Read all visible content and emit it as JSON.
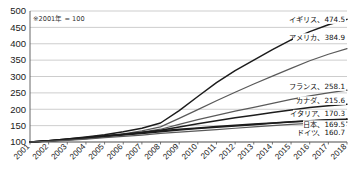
{
  "note": "※2001年 = 100",
  "chart_data": {
    "type": "line",
    "title": "",
    "subtitle": "",
    "xlabel": "",
    "ylabel": "",
    "note": "※2001年 = 100",
    "grid": true,
    "legend_position": "inline-right-end-labels",
    "ylim": [
      100,
      500
    ],
    "yticks": [
      100,
      150,
      200,
      250,
      300,
      350,
      400,
      450,
      500
    ],
    "ytick_labels": [
      "100",
      "150",
      "200",
      "250",
      "300",
      "350",
      "400",
      "450",
      "500"
    ],
    "x": [
      2001,
      2002,
      2003,
      2004,
      2005,
      2006,
      2007,
      2008,
      2009,
      2010,
      2011,
      2012,
      2013,
      2014,
      2015,
      2016,
      2017,
      2018
    ],
    "xtick_labels": [
      "2001",
      "2002",
      "2003",
      "2004",
      "2005",
      "2006",
      "2007",
      "2008",
      "2009",
      "2010",
      "2011",
      "2012",
      "2013",
      "2014",
      "2015",
      "2016",
      "2017",
      "2018"
    ],
    "series": [
      {
        "name": "イギリス",
        "end_label": "イギリス、474.5",
        "end_value": 474.5,
        "values": [
          100,
          104,
          109,
          115,
          122,
          131,
          142,
          158,
          196,
          239,
          281,
          318,
          350,
          382,
          412,
          437,
          458,
          474.5
        ]
      },
      {
        "name": "アメリカ",
        "end_label": "アメリカ、384.9",
        "end_value": 384.9,
        "values": [
          100,
          103,
          107,
          112,
          118,
          125,
          134,
          146,
          172,
          199,
          226,
          252,
          277,
          301,
          325,
          348,
          368,
          384.9
        ]
      },
      {
        "name": "フランス",
        "end_label": "フランス、258.1",
        "end_value": 258.1,
        "values": [
          100,
          103,
          107,
          112,
          117,
          123,
          130,
          139,
          154,
          168,
          181,
          194,
          206,
          218,
          230,
          241,
          250,
          258.1
        ]
      },
      {
        "name": "カナダ",
        "end_label": "カナダ、215.6",
        "end_value": 215.6,
        "values": [
          100,
          104,
          108,
          113,
          118,
          123,
          129,
          136,
          146,
          156,
          165,
          174,
          182,
          190,
          198,
          205,
          211,
          215.6
        ]
      },
      {
        "name": "イタリア",
        "end_label": "イタリア、170.3",
        "end_value": 170.3,
        "values": [
          100,
          104,
          109,
          114,
          119,
          124,
          129,
          134,
          139,
          143,
          147,
          151,
          155,
          158,
          162,
          165,
          168,
          170.3
        ]
      },
      {
        "name": "日本",
        "end_label": "日本、169.5",
        "end_value": 169.5,
        "values": [
          100,
          103,
          107,
          111,
          116,
          121,
          126,
          131,
          137,
          141,
          145,
          149,
          153,
          157,
          161,
          164,
          167,
          169.5
        ]
      },
      {
        "name": "ドイツ",
        "end_label": "ドイツ、160.7",
        "end_value": 160.7,
        "values": [
          100,
          102,
          105,
          109,
          113,
          117,
          121,
          126,
          130,
          134,
          138,
          142,
          146,
          150,
          154,
          157,
          159,
          160.7
        ]
      }
    ],
    "end_labels": [
      {
        "text": "イギリス、474.5",
        "value": 474.5
      },
      {
        "text": "アメリカ、384.9",
        "value": 384.9
      },
      {
        "text": "フランス、258.1",
        "value": 258.1
      },
      {
        "text": "カナダ、215.6",
        "value": 215.6
      },
      {
        "text": "イタリア、170.3",
        "value": 170.3
      },
      {
        "text": "日本、169.5",
        "value": 169.5
      },
      {
        "text": "ドイツ、160.7",
        "value": 160.7
      }
    ]
  }
}
